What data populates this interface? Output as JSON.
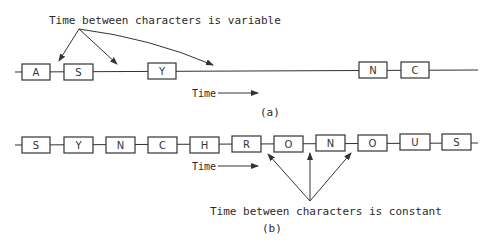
{
  "diagram_a": {
    "caption": "(a)",
    "annotation": "Time between characters is variable",
    "time_label": "Time",
    "characters": [
      "A",
      "S",
      "Y",
      "N",
      "C"
    ]
  },
  "diagram_b": {
    "caption": "(b)",
    "annotation": "Time between characters is constant",
    "time_label": "Time",
    "characters": [
      "S",
      "Y",
      "N",
      "C",
      "H",
      "R",
      "O",
      "N",
      "O",
      "U",
      "S"
    ]
  },
  "colors": {
    "stroke": "#333333",
    "text": "#2a2a2a",
    "background": "#ffffff"
  }
}
